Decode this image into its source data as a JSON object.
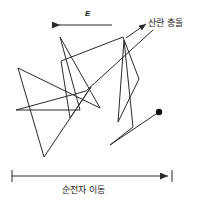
{
  "figure": {
    "width": 197,
    "height": 211,
    "background_color": "#ffffff",
    "stroke_color": "#2a2a2a",
    "text_color": "#1a1a1a"
  },
  "labels": {
    "field": {
      "text": "E",
      "semantic": "electric-field-symbol",
      "x": 85,
      "y": 10
    },
    "collision": {
      "text": "산란 충돌",
      "semantic": "scattering-collision-annotation",
      "x": 148,
      "y": 19
    },
    "drift": {
      "text": "순전자 이동",
      "semantic": "net-electron-drift-annotation",
      "x": 62,
      "y": 186
    }
  },
  "annotations": {
    "field_arrow": {
      "name": "field-direction-arrow",
      "direction": "left",
      "x1": 112,
      "y1": 25,
      "x2": 52,
      "y2": 25
    },
    "collision_leader": {
      "name": "collision-leader-arrow",
      "direction": "up-right",
      "x1": 126,
      "y1": 38,
      "x2": 146,
      "y2": 24
    },
    "drift_measure": {
      "name": "drift-extent-measure",
      "x1": 12,
      "x2": 168,
      "y": 176,
      "tick_half_height": 6,
      "arrowhead": "right"
    }
  },
  "chart_data": {
    "type": "line",
    "title": "",
    "path_points": [
      [
        159,
        112
      ],
      [
        110,
        145
      ],
      [
        133,
        127
      ],
      [
        124,
        40
      ],
      [
        118,
        122
      ],
      [
        139,
        79
      ],
      [
        123,
        37
      ],
      [
        61,
        61
      ],
      [
        70,
        118
      ],
      [
        91,
        87
      ],
      [
        44,
        157
      ],
      [
        18,
        68
      ],
      [
        100,
        108
      ],
      [
        60,
        37
      ],
      [
        80,
        110
      ],
      [
        16,
        110
      ],
      [
        86,
        91
      ],
      [
        153,
        30
      ]
    ],
    "start_marker": {
      "name": "electron-start-dot",
      "x": 159,
      "y": 112,
      "radius": 3.2,
      "filled": true
    },
    "collision_vertices": [
      [
        110,
        145
      ],
      [
        133,
        127
      ],
      [
        124,
        40
      ],
      [
        118,
        122
      ],
      [
        139,
        79
      ],
      [
        123,
        37
      ],
      [
        61,
        61
      ],
      [
        70,
        118
      ],
      [
        91,
        87
      ],
      [
        44,
        157
      ],
      [
        18,
        68
      ],
      [
        100,
        108
      ],
      [
        60,
        37
      ],
      [
        80,
        110
      ],
      [
        16,
        110
      ],
      [
        86,
        91
      ]
    ],
    "xlabel": "",
    "ylabel": "",
    "legend": []
  }
}
